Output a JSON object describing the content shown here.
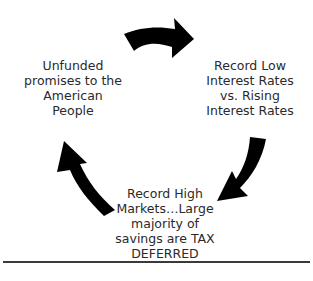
{
  "diagram": {
    "type": "cycle",
    "nodes": [
      {
        "id": "left",
        "label": "Unfunded promises to the American People",
        "lines": [
          "Unfunded",
          "promises to the",
          "American",
          "People"
        ]
      },
      {
        "id": "right",
        "label": "Record Low Interest Rates vs. Rising Interest Rates",
        "lines": [
          "Record Low",
          "Interest Rates",
          "vs. Rising",
          "Interest Rates"
        ]
      },
      {
        "id": "bottom",
        "label": "Record High Markets...Large majority of savings are TAX DEFERRED",
        "lines": [
          "Record High",
          "Markets…Large",
          "majority of",
          "savings are TAX",
          "DEFERRED"
        ]
      }
    ],
    "edges": [
      {
        "from": "left",
        "to": "right",
        "icon": "curved-arrow-right"
      },
      {
        "from": "right",
        "to": "bottom",
        "icon": "curved-arrow-down-left"
      },
      {
        "from": "bottom",
        "to": "left",
        "icon": "curved-arrow-up-left"
      }
    ],
    "colors": {
      "arrow": "#000000",
      "text": "#2a2a2a",
      "divider": "#3a3a3a",
      "background": "#ffffff"
    }
  }
}
